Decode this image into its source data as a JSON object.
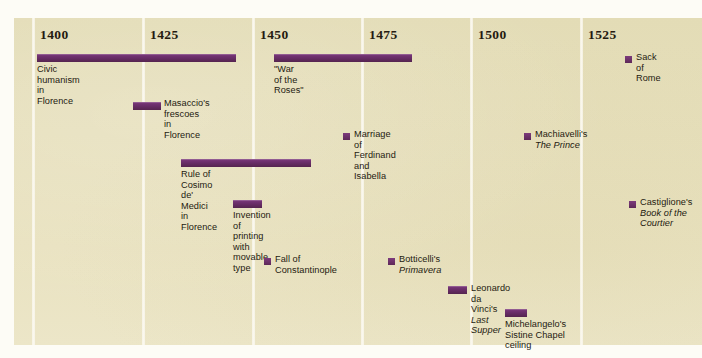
{
  "panel": {
    "background_color": "#e6dfbb",
    "accent_color": "#6d2f6d",
    "gridline_color": "#fbf8ee"
  },
  "axis": {
    "label": "Year",
    "ticks": [
      {
        "year": "1400",
        "x": 32
      },
      {
        "year": "1425",
        "x": 142
      },
      {
        "year": "1450",
        "x": 252
      },
      {
        "year": "1475",
        "x": 361
      },
      {
        "year": "1500",
        "x": 470
      },
      {
        "year": "1525",
        "x": 580
      }
    ]
  },
  "chart_data": {
    "type": "bar",
    "xlabel": "Year",
    "ylabel": "",
    "xlim": [
      1392,
      1537
    ],
    "grid": true,
    "legend": "none",
    "orientation": "horizontal",
    "categories": [
      "Civic humanism in Florence",
      "\"War of the Roses\"",
      "Sack of Rome",
      "Masaccio's frescoes in Florence",
      "Marriage of Ferdinand and Isabella",
      "Machiavelli's The Prince",
      "Rule of Cosimo de' Medici in Florence",
      "Invention of printing with movable type",
      "Castiglione's Book of the Courtier",
      "Fall of Constantinople",
      "Botticelli's Primavera",
      "Leonardo da Vinci's Last Supper",
      "Michelangelo's Sistine Chapel ceiling"
    ],
    "values": [
      45,
      31,
      0,
      6,
      0,
      0,
      30,
      7,
      0,
      0,
      0,
      4,
      5
    ]
  },
  "events": [
    {
      "id": "civic-humanism",
      "label": "Civic humanism in Florence",
      "title_italic": "",
      "kind": "bar",
      "start_year": 1401,
      "end_year": 1446,
      "bar_left": 37,
      "bar_width": 199,
      "bar_top": 54,
      "label_left": 37,
      "label_top": 64
    },
    {
      "id": "war-of-the-roses",
      "label": "\"War of the Roses\"",
      "title_italic": "",
      "kind": "bar",
      "start_year": 1455,
      "end_year": 1486,
      "bar_left": 274,
      "bar_width": 138,
      "bar_top": 54,
      "label_left": 274,
      "label_top": 64
    },
    {
      "id": "sack-of-rome",
      "label": "Sack of Rome",
      "title_italic": "",
      "kind": "marker",
      "start_year": 1527,
      "end_year": 1527,
      "bar_left": 625,
      "bar_width": 7,
      "bar_top": 56,
      "label_left": 636,
      "label_top": 52
    },
    {
      "id": "masaccio-frescoes",
      "label": "Masaccio's frescoes\nin Florence",
      "title_italic": "",
      "kind": "bar",
      "start_year": 1424,
      "end_year": 1430,
      "bar_left": 133,
      "bar_width": 28,
      "bar_top": 102,
      "label_left": 164,
      "label_top": 98
    },
    {
      "id": "marriage-ferdinand-isabella",
      "label": "Marriage of Ferdinand and Isabella",
      "title_italic": "",
      "kind": "marker",
      "start_year": 1469,
      "end_year": 1469,
      "bar_left": 343,
      "bar_width": 7,
      "bar_top": 133,
      "label_left": 354,
      "label_top": 129
    },
    {
      "id": "machiavelli-the-prince",
      "label": "Machiavelli's ",
      "title_italic": "The Prince",
      "kind": "marker",
      "start_year": 1513,
      "end_year": 1513,
      "bar_left": 524,
      "bar_width": 7,
      "bar_top": 133,
      "label_left": 535,
      "label_top": 129
    },
    {
      "id": "rule-of-cosimo-de-medici",
      "label": "Rule of Cosimo de' Medici\nin Florence",
      "title_italic": "",
      "kind": "bar",
      "start_year": 1434,
      "end_year": 1464,
      "bar_left": 181,
      "bar_width": 130,
      "bar_top": 159,
      "label_left": 181,
      "label_top": 169
    },
    {
      "id": "invention-of-printing",
      "label": "Invention of printing\nwith movable type",
      "title_italic": "",
      "kind": "bar",
      "start_year": 1445,
      "end_year": 1452,
      "bar_left": 233,
      "bar_width": 29,
      "bar_top": 200,
      "label_left": 233,
      "label_top": 210
    },
    {
      "id": "castiglione-book-of-the-courtier",
      "label": "Castiglione's\n",
      "title_italic": "Book of the\nCourtier",
      "kind": "marker",
      "start_year": 1528,
      "end_year": 1528,
      "bar_left": 629,
      "bar_width": 7,
      "bar_top": 201,
      "label_left": 640,
      "label_top": 197
    },
    {
      "id": "fall-of-constantinople",
      "label": "Fall of Constantinople",
      "title_italic": "",
      "kind": "marker",
      "start_year": 1453,
      "end_year": 1453,
      "bar_left": 264,
      "bar_width": 7,
      "bar_top": 258,
      "label_left": 275,
      "label_top": 254
    },
    {
      "id": "botticelli-primavera",
      "label": "Botticelli's ",
      "title_italic": "Primavera",
      "kind": "marker",
      "start_year": 1482,
      "end_year": 1482,
      "bar_left": 388,
      "bar_width": 7,
      "bar_top": 258,
      "label_left": 399,
      "label_top": 254
    },
    {
      "id": "leonardo-last-supper",
      "label": "Leonardo da Vinci's ",
      "title_italic": "Last Supper",
      "kind": "bar",
      "start_year": 1495,
      "end_year": 1498,
      "bar_left": 448,
      "bar_width": 19,
      "bar_top": 286,
      "label_left": 471,
      "label_top": 283
    },
    {
      "id": "michelangelo-sistine-chapel",
      "label": "Michelangelo's Sistine Chapel ceiling",
      "title_italic": "",
      "kind": "bar",
      "start_year": 1508,
      "end_year": 1512,
      "bar_left": 505,
      "bar_width": 22,
      "bar_top": 309,
      "label_left": 505,
      "label_top": 319
    }
  ]
}
